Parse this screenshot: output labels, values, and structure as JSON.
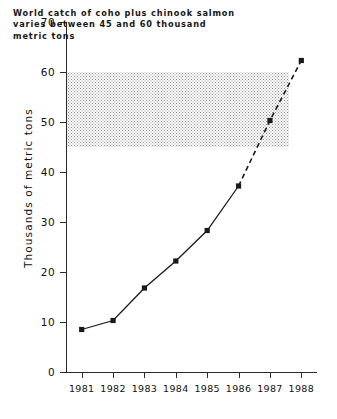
{
  "chart_data": {
    "type": "line",
    "title": "",
    "xlabel": "",
    "ylabel": "Thousands of metric tons",
    "categories": [
      "1981",
      "1982",
      "1983",
      "1984",
      "1985",
      "1986",
      "1987",
      "1988"
    ],
    "x": [
      1981,
      1982,
      1983,
      1984,
      1985,
      1986,
      1987,
      1988
    ],
    "values": [
      8.5,
      10.3,
      16.8,
      22.2,
      28.3,
      37.2,
      50.3,
      62.3
    ],
    "series": [
      {
        "name": "World catch of coho plus chinook salmon",
        "values": [
          8.5,
          10.3,
          16.8,
          22.2,
          28.3,
          37.2,
          50.3,
          62.3
        ],
        "observed_through": 1986,
        "projected_from": 1986,
        "line_style_observed": "solid",
        "line_style_projected": "dashed",
        "marker": "filled-square",
        "color": "#1a1a1a"
      }
    ],
    "ylim": [
      0,
      70
    ],
    "yticks": [
      0,
      10,
      20,
      30,
      40,
      50,
      60,
      70
    ],
    "ytick_labels": [
      "0",
      "10",
      "20",
      "30",
      "40",
      "50",
      "60",
      "70"
    ],
    "xlim": [
      1980.5,
      1988.5
    ],
    "grid": false,
    "legend": "none",
    "annotations": [
      {
        "name": "callout-text",
        "lines": [
          "World catch of coho plus chinook salmon",
          "varies between 45 and 60 thousand",
          "metric tons"
        ]
      }
    ],
    "shaded_band": {
      "name": "reference-band",
      "y_min": 45,
      "y_max": 60,
      "fill": "stipple-dot",
      "color": "#8e8e8e",
      "x_end_year": 1987.6
    },
    "colors": {
      "axis": "#2b2b2b",
      "data": "#1a1a1a",
      "band": "#8e8e8e",
      "background": "#ffffff"
    }
  }
}
